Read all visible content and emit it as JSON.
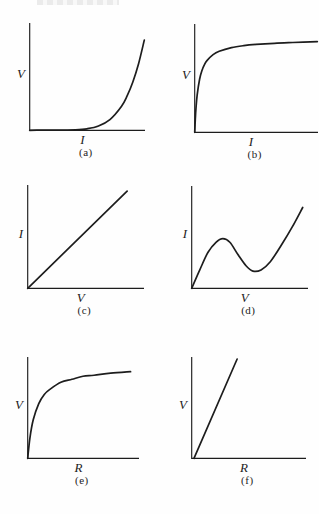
{
  "page": {
    "background": "#fefefe",
    "ink_color": "#1d1d1d",
    "top_edge_artifact": "faint cropped printed text, illegible"
  },
  "figure": {
    "layout": "3 rows x 2 columns of unlabeled-axis sketch graphs",
    "panel_count": 6
  },
  "chart_data": [
    {
      "panel": "a",
      "type": "line",
      "title": "",
      "xlabel": "I",
      "ylabel": "V",
      "caption": "(a)",
      "axis_ticks": "none",
      "x_range_normalized": [
        0,
        1
      ],
      "y_range_normalized": [
        0,
        1
      ],
      "curve_shape": "convex increasing, exponential-like: V stays near zero then rises steeply with I",
      "points_normalized": [
        [
          0,
          0
        ],
        [
          0.1,
          0.001
        ],
        [
          0.2,
          0.001
        ],
        [
          0.3,
          0.002
        ],
        [
          0.4,
          0.004
        ],
        [
          0.5,
          0.014
        ],
        [
          0.6,
          0.04
        ],
        [
          0.7,
          0.1
        ],
        [
          0.8,
          0.222
        ],
        [
          0.85,
          0.32
        ],
        [
          0.9,
          0.45
        ],
        [
          0.95,
          0.62
        ],
        [
          1,
          0.84
        ]
      ]
    },
    {
      "panel": "b",
      "type": "line",
      "title": "",
      "xlabel": "I",
      "ylabel": "V",
      "caption": "(b)",
      "axis_ticks": "none",
      "x_range_normalized": [
        0,
        1
      ],
      "y_range_normalized": [
        0,
        1
      ],
      "curve_shape": "concave saturating: V rises almost vertically from origin then levels toward a plateau",
      "points_normalized": [
        [
          0,
          0
        ],
        [
          0.005,
          0.12
        ],
        [
          0.01,
          0.215
        ],
        [
          0.02,
          0.344
        ],
        [
          0.04,
          0.49
        ],
        [
          0.06,
          0.573
        ],
        [
          0.08,
          0.625
        ],
        [
          0.1,
          0.662
        ],
        [
          0.15,
          0.717
        ],
        [
          0.2,
          0.748
        ],
        [
          0.3,
          0.782
        ],
        [
          0.4,
          0.8
        ],
        [
          0.5,
          0.811
        ],
        [
          0.65,
          0.822
        ],
        [
          0.8,
          0.829
        ],
        [
          1,
          0.837
        ]
      ]
    },
    {
      "panel": "c",
      "type": "line",
      "title": "",
      "xlabel": "V",
      "ylabel": "I",
      "caption": "(c)",
      "axis_ticks": "none",
      "x_range_normalized": [
        0,
        1
      ],
      "y_range_normalized": [
        0,
        1
      ],
      "curve_shape": "straight line through origin (ohmic, constant slope)",
      "points_normalized": [
        [
          0,
          0
        ],
        [
          0.86,
          0.94
        ]
      ]
    },
    {
      "panel": "d",
      "type": "line",
      "title": "",
      "xlabel": "V",
      "ylabel": "I",
      "caption": "(d)",
      "axis_ticks": "none",
      "x_range_normalized": [
        0,
        1
      ],
      "y_range_normalized": [
        0,
        1
      ],
      "curve_shape": "N-shaped: rises from origin to a local maximum near x=0.27, dips to a local minimum near x=0.53, then rises again",
      "points_normalized": [
        [
          0,
          0
        ],
        [
          0.07,
          0.18
        ],
        [
          0.14,
          0.35
        ],
        [
          0.21,
          0.45
        ],
        [
          0.27,
          0.485
        ],
        [
          0.33,
          0.45
        ],
        [
          0.4,
          0.33
        ],
        [
          0.47,
          0.22
        ],
        [
          0.53,
          0.168
        ],
        [
          0.6,
          0.18
        ],
        [
          0.68,
          0.26
        ],
        [
          0.78,
          0.43
        ],
        [
          0.87,
          0.6
        ],
        [
          0.96,
          0.79
        ]
      ]
    },
    {
      "panel": "e",
      "type": "line",
      "title": "",
      "xlabel": "R",
      "ylabel": "V",
      "caption": "(e)",
      "axis_ticks": "none",
      "x_range_normalized": [
        0,
        1
      ],
      "y_range_normalized": [
        0,
        1
      ],
      "curve_shape": "concave saturating: V rises steeply from origin and flattens toward a plateau as R grows",
      "points_normalized": [
        [
          0,
          0
        ],
        [
          0.02,
          0.2
        ],
        [
          0.05,
          0.38
        ],
        [
          0.1,
          0.54
        ],
        [
          0.15,
          0.63
        ],
        [
          0.2,
          0.68
        ],
        [
          0.3,
          0.75
        ],
        [
          0.4,
          0.78
        ],
        [
          0.5,
          0.81
        ],
        [
          0.6,
          0.82
        ],
        [
          0.75,
          0.84
        ],
        [
          0.93,
          0.855
        ]
      ]
    },
    {
      "panel": "f",
      "type": "line",
      "title": "",
      "xlabel": "R",
      "ylabel": "V",
      "caption": "(f)",
      "axis_ticks": "none",
      "x_range_normalized": [
        0,
        1
      ],
      "y_range_normalized": [
        0,
        1
      ],
      "curve_shape": "steep straight line through origin (V proportional to R, large slope)",
      "points_normalized": [
        [
          0.02,
          0
        ],
        [
          0.4,
          0.98
        ]
      ]
    }
  ]
}
